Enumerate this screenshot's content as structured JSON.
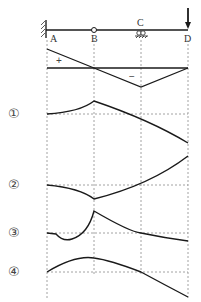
{
  "beam": {
    "points": [
      "A",
      "B",
      "C",
      "D"
    ],
    "support_A": "fixed",
    "hinge_B": "internal hinge",
    "support_C": "roller",
    "load_D": "downward point load"
  },
  "influence_line": {
    "signs": {
      "positive": "+",
      "negative": "−"
    }
  },
  "options": [
    {
      "label": "①"
    },
    {
      "label": "②"
    },
    {
      "label": "③"
    },
    {
      "label": "④"
    }
  ],
  "colors": {
    "line": "#1a1a1a",
    "grid": "#8a8a8a",
    "text": "#333333"
  }
}
